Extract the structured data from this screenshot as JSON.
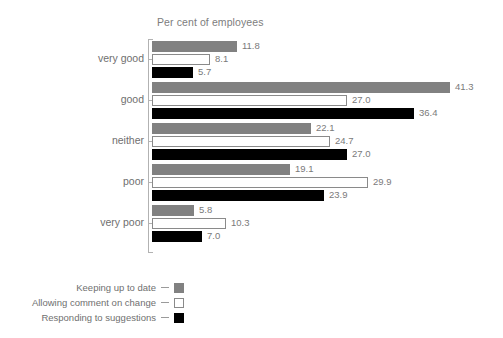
{
  "chart_data": {
    "type": "bar",
    "orientation": "horizontal",
    "title": "Per cent of employees",
    "xlabel": "",
    "ylabel": "",
    "xlim": [
      0,
      41.3
    ],
    "grid": false,
    "legend_position": "bottom-left",
    "categories": [
      "very good",
      "good",
      "neither",
      "poor",
      "very poor"
    ],
    "series": [
      {
        "name": "Keeping up to date",
        "color": "#818181",
        "style": "gray",
        "values": [
          11.8,
          41.3,
          22.1,
          19.1,
          5.8
        ],
        "labels": [
          "11.8",
          "41.3",
          "22.1",
          "19.1",
          "5.8"
        ]
      },
      {
        "name": "Allowing comment on change",
        "color": "#ffffff",
        "style": "white",
        "values": [
          8.1,
          27.0,
          24.7,
          29.9,
          10.3
        ],
        "labels": [
          "8.1",
          "27.0",
          "24.7",
          "29.9",
          "10.3"
        ]
      },
      {
        "name": "Responding to suggestions",
        "color": "#000000",
        "style": "black",
        "values": [
          5.7,
          36.4,
          27.0,
          23.9,
          7.0
        ],
        "labels": [
          "5.7",
          "36.4",
          "27.0",
          "23.9",
          "7.0"
        ]
      }
    ]
  },
  "axis": {
    "categories": [
      {
        "label": "very good"
      },
      {
        "label": "good"
      },
      {
        "label": "neither"
      },
      {
        "label": "poor"
      },
      {
        "label": "very poor"
      }
    ]
  },
  "legend": {
    "items": [
      {
        "label": "Keeping up to date",
        "style": "gray"
      },
      {
        "label": "Allowing comment on change",
        "style": "white"
      },
      {
        "label": "Responding to suggestions",
        "style": "black"
      }
    ]
  }
}
